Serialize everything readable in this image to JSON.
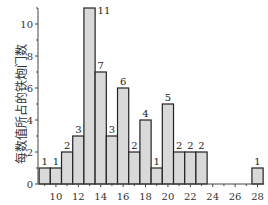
{
  "chart_data": {
    "type": "bar",
    "title": "",
    "xlabel": "",
    "ylabel": "每数值所占的铁炮门数",
    "categories": [
      9,
      10,
      11,
      12,
      13,
      14,
      15,
      16,
      17,
      18,
      19,
      20,
      21,
      22,
      23,
      24,
      25,
      26,
      27,
      28
    ],
    "values": [
      1,
      1,
      2,
      3,
      11,
      7,
      3,
      6,
      2,
      4,
      1,
      5,
      2,
      2,
      2,
      0,
      0,
      0,
      0,
      1
    ],
    "data_labels": [
      "1",
      "1",
      "2",
      "3",
      "11",
      "7",
      "3",
      "6",
      "2",
      "4",
      "1",
      "5",
      "2",
      "2",
      "2",
      "",
      "",
      "",
      "",
      "1"
    ],
    "xticks": [
      10,
      12,
      14,
      16,
      18,
      20,
      22,
      24,
      26,
      28
    ],
    "yticks": [
      0,
      2,
      4,
      6,
      8,
      10
    ],
    "xlim": [
      8.4,
      28.6
    ],
    "ylim": [
      0,
      11
    ],
    "grid": false,
    "legend": null,
    "bar_fill": "#d9d9d9",
    "bar_edge": "#222222"
  }
}
